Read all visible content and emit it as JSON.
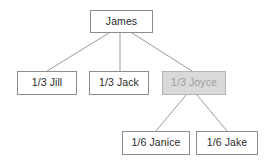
{
  "diagram": {
    "type": "family-inheritance-tree",
    "background_color": "#ffffff",
    "edge_color": "#9a9a9a",
    "node_border_color": "#8c8c8c",
    "node_text_color": "#2b2b2b",
    "highlight_fill_color": "#d9d9d9",
    "highlight_text_color": "#9e9e9e",
    "nodes": [
      {
        "id": "james",
        "label": "James",
        "share": "",
        "highlighted": false,
        "x": 90,
        "y": 10,
        "width": 63,
        "height": 23
      },
      {
        "id": "jill",
        "label": "1/3 Jill",
        "share": "1/3",
        "highlighted": false,
        "x": 17,
        "y": 71,
        "width": 60,
        "height": 24
      },
      {
        "id": "jack",
        "label": "1/3 Jack",
        "share": "1/3",
        "highlighted": false,
        "x": 89,
        "y": 71,
        "width": 60,
        "height": 24
      },
      {
        "id": "joyce",
        "label": "1/3 Joyce",
        "share": "1/3",
        "highlighted": true,
        "x": 162,
        "y": 71,
        "width": 64,
        "height": 24
      },
      {
        "id": "janice",
        "label": "1/6 Janice",
        "share": "1/6",
        "highlighted": false,
        "x": 122,
        "y": 131,
        "width": 68,
        "height": 24
      },
      {
        "id": "jake",
        "label": "1/6 Jake",
        "share": "1/6",
        "highlighted": false,
        "x": 196,
        "y": 131,
        "width": 62,
        "height": 24
      }
    ],
    "edges": [
      {
        "id": "james-jill",
        "from": "james",
        "to": "jill",
        "x1": 109,
        "y1": 33,
        "x2": 47,
        "y2": 71
      },
      {
        "id": "james-jack",
        "from": "james",
        "to": "jack",
        "x1": 120,
        "y1": 33,
        "x2": 120,
        "y2": 71
      },
      {
        "id": "james-joyce",
        "from": "james",
        "to": "joyce",
        "x1": 132,
        "y1": 33,
        "x2": 192,
        "y2": 71
      },
      {
        "id": "joyce-janice",
        "from": "joyce",
        "to": "janice",
        "x1": 186,
        "y1": 95,
        "x2": 156,
        "y2": 131
      },
      {
        "id": "joyce-jake",
        "from": "joyce",
        "to": "jake",
        "x1": 197,
        "y1": 95,
        "x2": 227,
        "y2": 131
      }
    ]
  }
}
